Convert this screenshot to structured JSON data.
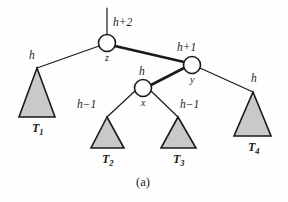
{
  "figure": {
    "caption": "(a)",
    "background_color": "#fefefe",
    "stroke_color": "#1a1a1a",
    "triangle_fill": "#c9c9c9",
    "node_fill": "#ffffff"
  },
  "nodes": [
    {
      "id": "z",
      "label": "z",
      "height_label": "h+2",
      "cx": 107,
      "cy": 43,
      "r": 8.5
    },
    {
      "id": "y",
      "label": "y",
      "height_label": "h+1",
      "cx": 192,
      "cy": 65,
      "r": 8.5
    },
    {
      "id": "x",
      "label": "x",
      "height_label": "h",
      "cx": 143,
      "cy": 88,
      "r": 8.5
    }
  ],
  "subtrees": [
    {
      "id": "T1",
      "label": "T",
      "subscript": "1",
      "height_label": "h",
      "apex_x": 37,
      "apex_y": 68,
      "base_left": 19,
      "base_right": 55,
      "base_y": 117
    },
    {
      "id": "T2",
      "label": "T",
      "subscript": "2",
      "height_label": "h−1",
      "apex_x": 107,
      "apex_y": 117,
      "base_left": 91,
      "base_right": 124,
      "base_y": 148
    },
    {
      "id": "T3",
      "label": "T",
      "subscript": "3",
      "height_label": "h−1",
      "apex_x": 178,
      "apex_y": 117,
      "base_left": 161,
      "base_right": 196,
      "base_y": 148
    },
    {
      "id": "T4",
      "label": "T",
      "subscript": "4",
      "height_label": "h",
      "apex_x": 253,
      "apex_y": 92,
      "base_left": 234,
      "base_right": 271,
      "base_y": 136
    }
  ],
  "edges": [
    {
      "id": "parent-stem",
      "from": "parent",
      "to": "z",
      "x1": 107,
      "y1": 8,
      "x2": 107,
      "y2": 34,
      "weight": "thin"
    },
    {
      "id": "z-to-T1",
      "from": "z",
      "to": "T1",
      "x1": 99,
      "y1": 46,
      "x2": 37,
      "y2": 68,
      "weight": "thin"
    },
    {
      "id": "z-to-y",
      "from": "z",
      "to": "y",
      "x1": 115,
      "y1": 46,
      "x2": 184,
      "y2": 62,
      "weight": "thick"
    },
    {
      "id": "y-to-x",
      "from": "y",
      "to": "x",
      "x1": 184,
      "y1": 68,
      "x2": 151,
      "y2": 85,
      "weight": "thick"
    },
    {
      "id": "y-to-T4",
      "from": "y",
      "to": "T4",
      "x1": 200,
      "y1": 68,
      "x2": 253,
      "y2": 92,
      "weight": "thin"
    },
    {
      "id": "x-to-T2",
      "from": "x",
      "to": "T2",
      "x1": 135,
      "y1": 91,
      "x2": 107,
      "y2": 117,
      "weight": "thin"
    },
    {
      "id": "x-to-T3",
      "from": "x",
      "to": "T3",
      "x1": 151,
      "y1": 91,
      "x2": 178,
      "y2": 117,
      "weight": "thin"
    }
  ],
  "height_labels": [
    {
      "id": "h-plus-2",
      "text": "h+2",
      "x": 113,
      "y": 17
    },
    {
      "id": "h-plus-1",
      "text": "h+1",
      "x": 177,
      "y": 42
    },
    {
      "id": "h-x",
      "text": "h",
      "x": 139,
      "y": 66
    },
    {
      "id": "h-t1",
      "text": "h",
      "x": 29,
      "y": 50
    },
    {
      "id": "h-t2",
      "text": "h−1",
      "x": 77,
      "y": 99
    },
    {
      "id": "h-t3",
      "text": "h−1",
      "x": 180,
      "y": 99
    },
    {
      "id": "h-t4",
      "text": "h",
      "x": 251,
      "y": 73
    }
  ],
  "node_labels": [
    {
      "id": "label-z",
      "text": "z",
      "x": 105,
      "y": 53
    },
    {
      "id": "label-y",
      "text": "y",
      "x": 190,
      "y": 75
    },
    {
      "id": "label-x",
      "text": "x",
      "x": 141,
      "y": 98
    }
  ],
  "subtree_labels": [
    {
      "id": "label-T1",
      "text": "T",
      "sub": "1",
      "x": 32,
      "y": 122
    },
    {
      "id": "label-T2",
      "text": "T",
      "sub": "2",
      "x": 102,
      "y": 153
    },
    {
      "id": "label-T3",
      "text": "T",
      "sub": "3",
      "x": 173,
      "y": 153
    },
    {
      "id": "label-T4",
      "text": "T",
      "sub": "4",
      "x": 248,
      "y": 141
    }
  ],
  "caption": {
    "text": "(a)",
    "x": 136,
    "y": 176
  }
}
